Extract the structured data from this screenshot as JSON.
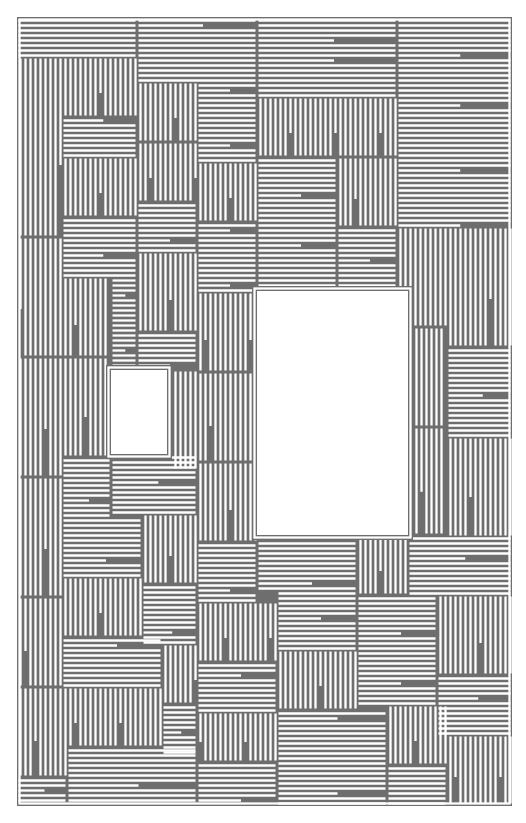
{
  "artwork": {
    "kind": "maze-labyrinth",
    "colors": {
      "line": "#6e6e6e",
      "background": "#ffffff"
    },
    "bounds": {
      "x": 17,
      "y": 17,
      "w": 495,
      "h": 789
    },
    "pitch": 5,
    "voids": [
      {
        "name": "small-void",
        "x": 111,
        "y": 370,
        "w": 56,
        "h": 84
      },
      {
        "name": "large-void",
        "x": 257,
        "y": 291,
        "w": 151,
        "h": 244
      }
    ],
    "regions": [
      {
        "x": 17,
        "y": 17,
        "w": 120,
        "h": 40,
        "dir": "h"
      },
      {
        "x": 137,
        "y": 17,
        "w": 120,
        "h": 40,
        "dir": "h"
      },
      {
        "x": 257,
        "y": 17,
        "w": 140,
        "h": 30,
        "dir": "h"
      },
      {
        "x": 397,
        "y": 17,
        "w": 115,
        "h": 60,
        "dir": "h"
      },
      {
        "x": 17,
        "y": 57,
        "w": 45,
        "h": 180,
        "dir": "v"
      },
      {
        "x": 62,
        "y": 57,
        "w": 75,
        "h": 60,
        "dir": "v"
      },
      {
        "x": 137,
        "y": 57,
        "w": 120,
        "h": 25,
        "dir": "h"
      },
      {
        "x": 257,
        "y": 47,
        "w": 140,
        "h": 50,
        "dir": "h"
      },
      {
        "x": 137,
        "y": 82,
        "w": 60,
        "h": 60,
        "dir": "v"
      },
      {
        "x": 197,
        "y": 82,
        "w": 60,
        "h": 80,
        "dir": "h"
      },
      {
        "x": 397,
        "y": 77,
        "w": 115,
        "h": 80,
        "dir": "h"
      },
      {
        "x": 62,
        "y": 117,
        "w": 75,
        "h": 40,
        "dir": "h"
      },
      {
        "x": 257,
        "y": 97,
        "w": 140,
        "h": 60,
        "dir": "v"
      },
      {
        "x": 137,
        "y": 142,
        "w": 60,
        "h": 60,
        "dir": "v"
      },
      {
        "x": 62,
        "y": 157,
        "w": 75,
        "h": 60,
        "dir": "v"
      },
      {
        "x": 197,
        "y": 162,
        "w": 60,
        "h": 60,
        "dir": "v"
      },
      {
        "x": 257,
        "y": 157,
        "w": 80,
        "h": 60,
        "dir": "h"
      },
      {
        "x": 337,
        "y": 157,
        "w": 60,
        "h": 70,
        "dir": "v"
      },
      {
        "x": 397,
        "y": 157,
        "w": 115,
        "h": 70,
        "dir": "h"
      },
      {
        "x": 137,
        "y": 202,
        "w": 60,
        "h": 50,
        "dir": "h"
      },
      {
        "x": 62,
        "y": 217,
        "w": 75,
        "h": 60,
        "dir": "h"
      },
      {
        "x": 17,
        "y": 237,
        "w": 45,
        "h": 120,
        "dir": "v"
      },
      {
        "x": 197,
        "y": 222,
        "w": 60,
        "h": 70,
        "dir": "h"
      },
      {
        "x": 257,
        "y": 217,
        "w": 80,
        "h": 74,
        "dir": "h"
      },
      {
        "x": 337,
        "y": 227,
        "w": 60,
        "h": 64,
        "dir": "h"
      },
      {
        "x": 397,
        "y": 227,
        "w": 50,
        "h": 100,
        "dir": "v"
      },
      {
        "x": 447,
        "y": 227,
        "w": 65,
        "h": 120,
        "dir": "v"
      },
      {
        "x": 137,
        "y": 252,
        "w": 60,
        "h": 80,
        "dir": "v"
      },
      {
        "x": 62,
        "y": 277,
        "w": 49,
        "h": 80,
        "dir": "v"
      },
      {
        "x": 197,
        "y": 292,
        "w": 60,
        "h": 80,
        "dir": "v"
      },
      {
        "x": 111,
        "y": 277,
        "w": 26,
        "h": 93,
        "dir": "h"
      },
      {
        "x": 137,
        "y": 332,
        "w": 60,
        "h": 38,
        "dir": "h"
      },
      {
        "x": 408,
        "y": 327,
        "w": 39,
        "h": 100,
        "dir": "v"
      },
      {
        "x": 447,
        "y": 347,
        "w": 65,
        "h": 90,
        "dir": "h"
      },
      {
        "x": 17,
        "y": 357,
        "w": 45,
        "h": 120,
        "dir": "v"
      },
      {
        "x": 62,
        "y": 357,
        "w": 49,
        "h": 100,
        "dir": "v"
      },
      {
        "x": 167,
        "y": 370,
        "w": 30,
        "h": 100,
        "dir": "v"
      },
      {
        "x": 197,
        "y": 372,
        "w": 60,
        "h": 90,
        "dir": "v"
      },
      {
        "x": 408,
        "y": 427,
        "w": 39,
        "h": 108,
        "dir": "v"
      },
      {
        "x": 447,
        "y": 437,
        "w": 65,
        "h": 100,
        "dir": "v"
      },
      {
        "x": 62,
        "y": 457,
        "w": 49,
        "h": 60,
        "dir": "h"
      },
      {
        "x": 111,
        "y": 454,
        "w": 86,
        "h": 60,
        "dir": "h"
      },
      {
        "x": 197,
        "y": 462,
        "w": 60,
        "h": 80,
        "dir": "v"
      },
      {
        "x": 17,
        "y": 477,
        "w": 45,
        "h": 120,
        "dir": "v"
      },
      {
        "x": 62,
        "y": 517,
        "w": 80,
        "h": 60,
        "dir": "h"
      },
      {
        "x": 142,
        "y": 514,
        "w": 55,
        "h": 70,
        "dir": "v"
      },
      {
        "x": 197,
        "y": 542,
        "w": 60,
        "h": 60,
        "dir": "h"
      },
      {
        "x": 257,
        "y": 535,
        "w": 100,
        "h": 55,
        "dir": "h"
      },
      {
        "x": 357,
        "y": 535,
        "w": 51,
        "h": 60,
        "dir": "v"
      },
      {
        "x": 408,
        "y": 535,
        "w": 104,
        "h": 60,
        "dir": "h"
      },
      {
        "x": 62,
        "y": 577,
        "w": 80,
        "h": 60,
        "dir": "v"
      },
      {
        "x": 142,
        "y": 584,
        "w": 55,
        "h": 60,
        "dir": "h"
      },
      {
        "x": 197,
        "y": 602,
        "w": 80,
        "h": 60,
        "dir": "v"
      },
      {
        "x": 277,
        "y": 590,
        "w": 80,
        "h": 60,
        "dir": "h"
      },
      {
        "x": 357,
        "y": 595,
        "w": 80,
        "h": 60,
        "dir": "h"
      },
      {
        "x": 437,
        "y": 595,
        "w": 75,
        "h": 80,
        "dir": "v"
      },
      {
        "x": 17,
        "y": 597,
        "w": 45,
        "h": 90,
        "dir": "v"
      },
      {
        "x": 62,
        "y": 637,
        "w": 100,
        "h": 50,
        "dir": "h"
      },
      {
        "x": 162,
        "y": 644,
        "w": 35,
        "h": 60,
        "dir": "v"
      },
      {
        "x": 197,
        "y": 662,
        "w": 80,
        "h": 50,
        "dir": "h"
      },
      {
        "x": 277,
        "y": 650,
        "w": 80,
        "h": 60,
        "dir": "v"
      },
      {
        "x": 357,
        "y": 655,
        "w": 80,
        "h": 50,
        "dir": "h"
      },
      {
        "x": 437,
        "y": 675,
        "w": 75,
        "h": 60,
        "dir": "h"
      },
      {
        "x": 17,
        "y": 687,
        "w": 50,
        "h": 90,
        "dir": "v"
      },
      {
        "x": 67,
        "y": 687,
        "w": 95,
        "h": 60,
        "dir": "v"
      },
      {
        "x": 162,
        "y": 704,
        "w": 35,
        "h": 50,
        "dir": "h"
      },
      {
        "x": 197,
        "y": 712,
        "w": 80,
        "h": 50,
        "dir": "v"
      },
      {
        "x": 277,
        "y": 710,
        "w": 110,
        "h": 60,
        "dir": "h"
      },
      {
        "x": 387,
        "y": 705,
        "w": 60,
        "h": 60,
        "dir": "v"
      },
      {
        "x": 447,
        "y": 735,
        "w": 65,
        "h": 70,
        "dir": "v"
      },
      {
        "x": 67,
        "y": 747,
        "w": 130,
        "h": 59,
        "dir": "h"
      },
      {
        "x": 197,
        "y": 762,
        "w": 80,
        "h": 44,
        "dir": "h"
      },
      {
        "x": 277,
        "y": 770,
        "w": 110,
        "h": 36,
        "dir": "h"
      },
      {
        "x": 387,
        "y": 765,
        "w": 60,
        "h": 41,
        "dir": "h"
      },
      {
        "x": 17,
        "y": 777,
        "w": 50,
        "h": 29,
        "dir": "h"
      }
    ]
  }
}
